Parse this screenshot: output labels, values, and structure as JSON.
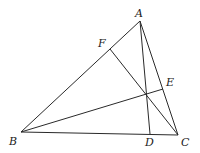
{
  "diagram": {
    "type": "geometry",
    "points": {
      "A": {
        "label": "A",
        "x": 140,
        "y": 21,
        "lx": 135,
        "ly": 17
      },
      "B": {
        "label": "B",
        "x": 21,
        "y": 132,
        "lx": 9,
        "ly": 145
      },
      "C": {
        "label": "C",
        "x": 178,
        "y": 135,
        "lx": 181,
        "ly": 146
      },
      "D": {
        "label": "D",
        "x": 150,
        "y": 134,
        "lx": 145,
        "ly": 146
      },
      "E": {
        "label": "E",
        "x": 163,
        "y": 89,
        "lx": 166,
        "ly": 86
      },
      "F": {
        "label": "F",
        "x": 110,
        "y": 49,
        "lx": 98,
        "ly": 47
      },
      "H": {
        "x": 146,
        "y": 94
      }
    },
    "segments": [
      [
        "A",
        "B"
      ],
      [
        "B",
        "C"
      ],
      [
        "C",
        "A"
      ],
      [
        "A",
        "D"
      ],
      [
        "B",
        "E"
      ],
      [
        "C",
        "F"
      ]
    ]
  }
}
